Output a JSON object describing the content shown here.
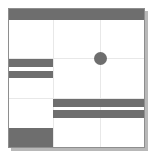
{
  "canvas": {
    "width": 153,
    "height": 157,
    "background": "#ffffff"
  },
  "frame": {
    "x": 8,
    "y": 8,
    "width": 137,
    "height": 140,
    "border_color": "#8e8e8e",
    "fill": "#ffffff"
  },
  "palette": {
    "block_fill": "#6e6e6e",
    "grid_line": "#e8e8e8",
    "frame_border": "#8e8e8e",
    "shadow": "#b8b8b8",
    "page_background": "#ffffff"
  },
  "grid": {
    "vertical_lines": [
      {
        "name": "grid-line-v-1",
        "x": 53,
        "y": 9,
        "height": 138
      },
      {
        "name": "grid-line-v-2",
        "x": 100,
        "y": 9,
        "height": 138
      }
    ],
    "horizontal_lines": [
      {
        "name": "grid-line-h-1",
        "x": 9,
        "y": 58,
        "width": 135
      },
      {
        "name": "grid-line-h-2",
        "x": 9,
        "y": 98,
        "width": 135
      }
    ]
  },
  "blocks": [
    {
      "name": "header-bar",
      "x": 9,
      "y": 9,
      "width": 135,
      "height": 11
    },
    {
      "name": "left-bar-upper",
      "x": 9,
      "y": 59,
      "width": 44,
      "height": 8
    },
    {
      "name": "left-bar-lower",
      "x": 9,
      "y": 71,
      "width": 44,
      "height": 7
    },
    {
      "name": "right-bar-upper",
      "x": 53,
      "y": 99,
      "width": 91,
      "height": 8
    },
    {
      "name": "right-bar-lower",
      "x": 53,
      "y": 110,
      "width": 91,
      "height": 8
    },
    {
      "name": "bottom-left-block",
      "x": 9,
      "y": 128,
      "width": 44,
      "height": 19
    }
  ],
  "dot": {
    "name": "center-dot",
    "cx": 100,
    "cy": 58,
    "r": 6.5
  },
  "shadow": {
    "right": {
      "x": 145,
      "y": 11,
      "width": 3,
      "height": 139
    },
    "bottom": {
      "x": 11,
      "y": 148,
      "width": 137,
      "height": 3
    }
  }
}
